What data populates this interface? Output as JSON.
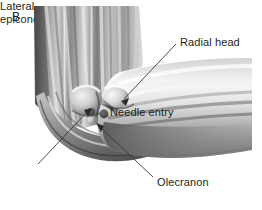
{
  "figure": {
    "panel_label": "B",
    "background_color": "#ffffff",
    "text_color": "#231f20",
    "leader_line_color": "#3a3a3a",
    "marker_color": "#4a4a4a"
  },
  "labels": {
    "radial_head": "Radial head",
    "needle_entry": "Needle entry",
    "olecranon": "Olecranon",
    "lateral_epicondyle_line1": "Lateral",
    "lateral_epicondyle_line2": "epicondyle"
  },
  "annotations": [
    {
      "name": "radial-head",
      "text": "Radial head",
      "text_x": 180,
      "text_y": 36,
      "leader_from": [
        176,
        44
      ],
      "leader_to": [
        121,
        101
      ],
      "arrow": true
    },
    {
      "name": "needle-entry",
      "text": "Needle entry",
      "text_x": 110,
      "text_y": 106,
      "leader_from": null,
      "leader_to": null,
      "arrow": false
    },
    {
      "name": "olecranon",
      "text": "Olecranon",
      "text_x": 157,
      "text_y": 176,
      "leader_from": [
        153,
        177
      ],
      "leader_to": [
        96,
        124
      ],
      "arrow": true
    },
    {
      "name": "lateral-epicondyle",
      "text": "Lateral epicondyle",
      "text_x": 6,
      "text_y": 168,
      "leader_from": [
        37,
        164
      ],
      "leader_to": [
        92,
        108
      ],
      "arrow": true
    }
  ],
  "markers": [
    {
      "name": "needle-entry-dot-medial",
      "cx": 91,
      "cy": 112,
      "r": 4.0
    },
    {
      "name": "needle-entry-dot-lateral",
      "cx": 104,
      "cy": 114,
      "r": 4.4
    }
  ]
}
